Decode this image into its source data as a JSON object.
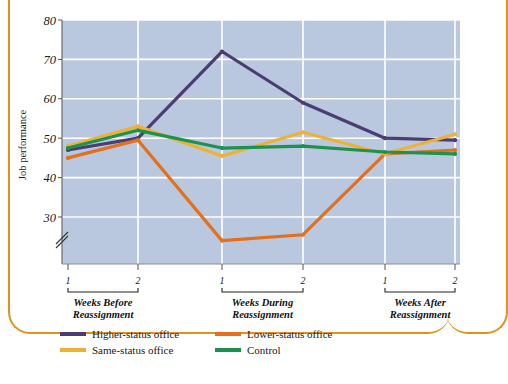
{
  "figure": {
    "border_color": "#e2901f",
    "plot_bg": "#b9c8de",
    "grid_color": "#ffffff"
  },
  "chart_data": {
    "type": "line",
    "title": "",
    "xlabel": "",
    "ylabel": "Job performance",
    "ylim": [
      30,
      80
    ],
    "yticks": [
      30,
      40,
      50,
      60,
      70,
      80
    ],
    "ytick_labels": [
      "30",
      "40",
      "50",
      "60",
      "70",
      "80"
    ],
    "axis_break": true,
    "axis_break_note": "y-axis broken below 30",
    "grid": true,
    "grid_axis": "both",
    "legend_position": "below",
    "x": [
      "1",
      "2",
      "1",
      "2",
      "1",
      "2"
    ],
    "categories": [
      "1",
      "2",
      "1",
      "2",
      "1",
      "2"
    ],
    "x_groups": [
      {
        "label": "Weeks Before Reassignment",
        "line1": "Weeks Before",
        "line2": "Reassignment",
        "ticks": [
          "1",
          "2"
        ]
      },
      {
        "label": "Weeks During Reassignment",
        "line1": "Weeks During",
        "line2": "Reassignment",
        "ticks": [
          "1",
          "2"
        ]
      },
      {
        "label": "Weeks After Reassignment",
        "line1": "Weeks After",
        "line2": "Reassignment",
        "ticks": [
          "1",
          "2"
        ]
      }
    ],
    "series": [
      {
        "name": "Higher-status office",
        "color": "#4a3d72",
        "values": [
          47,
          50,
          72,
          59,
          50,
          49.5
        ]
      },
      {
        "name": "Lower-status office",
        "color": "#e2701c",
        "values": [
          45,
          49.5,
          24,
          25.5,
          46,
          47
        ]
      },
      {
        "name": "Same-status office",
        "color": "#edb233",
        "values": [
          48,
          53,
          45.5,
          51.5,
          46,
          51
        ]
      },
      {
        "name": "Control",
        "color": "#1d9250",
        "values": [
          47.5,
          52,
          47.5,
          48,
          46.5,
          46
        ]
      }
    ]
  },
  "legend": {
    "items": [
      {
        "label": "Higher-status office",
        "color": "#4a3d72"
      },
      {
        "label": "Lower-status office",
        "color": "#e2701c"
      },
      {
        "label": "Same-status office",
        "color": "#edb233"
      },
      {
        "label": "Control",
        "color": "#1d9250"
      }
    ]
  }
}
